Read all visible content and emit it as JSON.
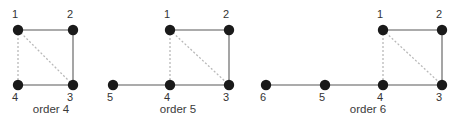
{
  "figure": {
    "title": "",
    "background_color": "#ffffff",
    "node_color": "#1a1a1a",
    "solid_edge_color": "#8f8f8f",
    "dashed_edge_color": "#b9b9b9",
    "label_color": "#333333",
    "caption_color": "#3a3a3a"
  },
  "chart_data": {
    "type": "diagram",
    "subtype": "node-link-graph-sequence",
    "title": "",
    "xlabel": "",
    "ylabel": "",
    "grid": false,
    "legend": null,
    "panels": [
      {
        "caption": "order 4",
        "caption_x": 51,
        "caption_y": 113,
        "node_count": 4,
        "nodes": [
          {
            "label": "1",
            "x": 18,
            "y": 30,
            "label_x": 15,
            "label_y": 18,
            "radius": 5.2
          },
          {
            "label": "2",
            "x": 73,
            "y": 30,
            "label_x": 70,
            "label_y": 18,
            "radius": 5.2
          },
          {
            "label": "3",
            "x": 73,
            "y": 85,
            "label_x": 70,
            "label_y": 101,
            "radius": 5.2
          },
          {
            "label": "4",
            "x": 18,
            "y": 85,
            "label_x": 15,
            "label_y": 101,
            "radius": 5.2
          }
        ],
        "edges": [
          {
            "from": "1",
            "to": "2",
            "style": "solid"
          },
          {
            "from": "2",
            "to": "3",
            "style": "solid"
          },
          {
            "from": "4",
            "to": "3",
            "style": "solid"
          },
          {
            "from": "1",
            "to": "4",
            "style": "dashed"
          },
          {
            "from": "1",
            "to": "3",
            "style": "dashed"
          }
        ]
      },
      {
        "caption": "order 5",
        "caption_x": 178,
        "caption_y": 113,
        "node_count": 5,
        "nodes": [
          {
            "label": "1",
            "x": 170,
            "y": 30,
            "label_x": 167,
            "label_y": 18,
            "radius": 5.2
          },
          {
            "label": "2",
            "x": 229,
            "y": 30,
            "label_x": 226,
            "label_y": 18,
            "radius": 5.2
          },
          {
            "label": "3",
            "x": 229,
            "y": 85,
            "label_x": 226,
            "label_y": 101,
            "radius": 5.2
          },
          {
            "label": "4",
            "x": 170,
            "y": 85,
            "label_x": 167,
            "label_y": 101,
            "radius": 5.2
          },
          {
            "label": "5",
            "x": 113,
            "y": 85,
            "label_x": 110,
            "label_y": 101,
            "radius": 5.2
          }
        ],
        "edges": [
          {
            "from": "1",
            "to": "2",
            "style": "solid"
          },
          {
            "from": "2",
            "to": "3",
            "style": "solid"
          },
          {
            "from": "4",
            "to": "3",
            "style": "solid"
          },
          {
            "from": "5",
            "to": "4",
            "style": "solid"
          },
          {
            "from": "1",
            "to": "4",
            "style": "dashed"
          },
          {
            "from": "1",
            "to": "3",
            "style": "dashed"
          }
        ]
      },
      {
        "caption": "order 6",
        "caption_x": 368,
        "caption_y": 113,
        "node_count": 6,
        "nodes": [
          {
            "label": "1",
            "x": 383,
            "y": 30,
            "label_x": 380,
            "label_y": 18,
            "radius": 5.2
          },
          {
            "label": "2",
            "x": 442,
            "y": 30,
            "label_x": 439,
            "label_y": 18,
            "radius": 5.2
          },
          {
            "label": "3",
            "x": 442,
            "y": 85,
            "label_x": 439,
            "label_y": 101,
            "radius": 5.2
          },
          {
            "label": "4",
            "x": 383,
            "y": 85,
            "label_x": 380,
            "label_y": 101,
            "radius": 5.2
          },
          {
            "label": "5",
            "x": 325,
            "y": 85,
            "label_x": 322,
            "label_y": 101,
            "radius": 5.2
          },
          {
            "label": "6",
            "x": 266,
            "y": 85,
            "label_x": 263,
            "label_y": 101,
            "radius": 5.2
          }
        ],
        "edges": [
          {
            "from": "1",
            "to": "2",
            "style": "solid"
          },
          {
            "from": "2",
            "to": "3",
            "style": "solid"
          },
          {
            "from": "4",
            "to": "3",
            "style": "solid"
          },
          {
            "from": "5",
            "to": "4",
            "style": "solid"
          },
          {
            "from": "6",
            "to": "5",
            "style": "solid"
          },
          {
            "from": "1",
            "to": "4",
            "style": "dashed"
          },
          {
            "from": "1",
            "to": "3",
            "style": "dashed"
          }
        ]
      }
    ]
  }
}
